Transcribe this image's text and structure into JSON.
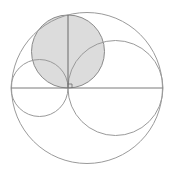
{
  "diagram": {
    "type": "geometry-arbelos",
    "colors": {
      "background": "#ffffff",
      "stroke": "#9a9a9a",
      "line": "#7a7a7a",
      "shade": "#dcdcdc"
    },
    "outer_circle": {
      "cx": 87,
      "cy": 88,
      "r": 75.5
    },
    "left_circle": {
      "cx": 39.5,
      "cy": 88,
      "r": 28.5
    },
    "right_circle": {
      "cx": 115.5,
      "cy": 88,
      "r": 47.5
    },
    "shaded_circle": {
      "cx": 68,
      "cy": 51.5,
      "r": 36.5
    },
    "diameter_line": {
      "x1": 11.5,
      "y1": 88,
      "x2": 162.5,
      "y2": 88
    },
    "perpendicular_line": {
      "x1": 68,
      "y1": 15,
      "x2": 68,
      "y2": 88
    },
    "right_angle_marker": {
      "x": 68,
      "y": 84,
      "size": 4
    }
  }
}
